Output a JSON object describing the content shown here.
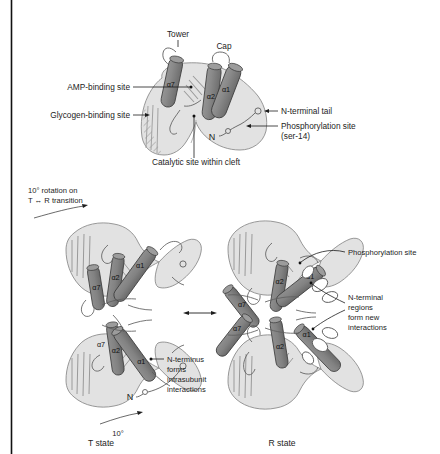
{
  "figure": {
    "border": {
      "left_rule_color": "#111111"
    }
  },
  "colors": {
    "body_fill": "#e2e2e2",
    "body_stroke": "#6f6f6f",
    "helix_fill": "#8a8a8a",
    "helix_fill_dark": "#7c7c7c",
    "helix_stroke": "#3a3a3a",
    "hatch_stroke": "#9a9a9a",
    "loop_stroke": "#5a5a5a",
    "text": "#1d1d1d",
    "leader": "#1d1d1d"
  },
  "panel_monomer": {
    "labels": {
      "tower": "Tower",
      "cap": "Cap",
      "amp_binding_site": "AMP-binding site",
      "glycogen_binding_site": "Glycogen-binding site",
      "catalytic_site": "Catalytic site within cleft",
      "n_terminal_tail": "N-terminal tail",
      "phosphorylation_site": "Phosphorylation site",
      "phosphorylation_site_detail": "(ser-14)",
      "n_terminus_marker": "N"
    },
    "helices": [
      {
        "name": "alpha7",
        "label": "α7"
      },
      {
        "name": "alpha2",
        "label": "α2"
      },
      {
        "name": "alpha1",
        "label": "α1"
      }
    ]
  },
  "panel_states": {
    "rotation_note": {
      "line1": "10° rotation on",
      "line2_prefix": "T",
      "line2_arrow": "↔",
      "line2_suffix": "R transition",
      "line2_full": "T ↔ R transition"
    },
    "t_state": {
      "caption": "T state",
      "rotation_label": "10°",
      "n_terminus_marker": "N",
      "annotation": {
        "line1": "N-terminus",
        "line2": "forms",
        "line3": "intrasubunit",
        "line4": "interactions"
      },
      "helices": [
        {
          "label": "α2",
          "subunit": "upper"
        },
        {
          "label": "α1",
          "subunit": "upper"
        },
        {
          "label": "α7",
          "subunit": "upper"
        },
        {
          "label": "α2",
          "subunit": "lower"
        },
        {
          "label": "α1",
          "subunit": "lower"
        },
        {
          "label": "α7",
          "subunit": "lower"
        }
      ]
    },
    "r_state": {
      "caption": "R state",
      "annotation_phospho": "Phosphorylation site",
      "annotation_nterm": {
        "line1": "N-terminal",
        "line2": "regions",
        "line3": "form new",
        "line4": "interactions"
      },
      "helices": [
        {
          "label": "α7",
          "subunit": "upper-left"
        },
        {
          "label": "α7",
          "subunit": "lower-left"
        },
        {
          "label": "α2",
          "subunit": "upper-right"
        },
        {
          "label": "α1",
          "subunit": "upper-right"
        },
        {
          "label": "α1",
          "subunit": "lower-right"
        },
        {
          "label": "α2",
          "subunit": "lower-right"
        }
      ]
    },
    "transition_arrow": "↔"
  }
}
